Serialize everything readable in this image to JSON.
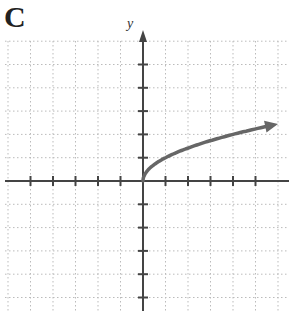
{
  "panel": {
    "label": "C"
  },
  "chart_data": {
    "type": "line",
    "title": "",
    "panel_label": "C",
    "xlabel": "",
    "ylabel": "y",
    "function": "y = sqrt(x)",
    "x": [
      0,
      0.25,
      0.5,
      1,
      2,
      3,
      4,
      5,
      6
    ],
    "series": [
      {
        "name": "y = √x",
        "values": [
          0,
          0.5,
          0.71,
          1,
          1.41,
          1.73,
          2,
          2.24,
          2.45
        ]
      }
    ],
    "xlim": [
      -6,
      6
    ],
    "ylim": [
      -5,
      6
    ],
    "grid": true,
    "grid_style": "dotted",
    "tick_spacing": 1,
    "arrow_at_end": true,
    "curve_color": "#666666"
  }
}
